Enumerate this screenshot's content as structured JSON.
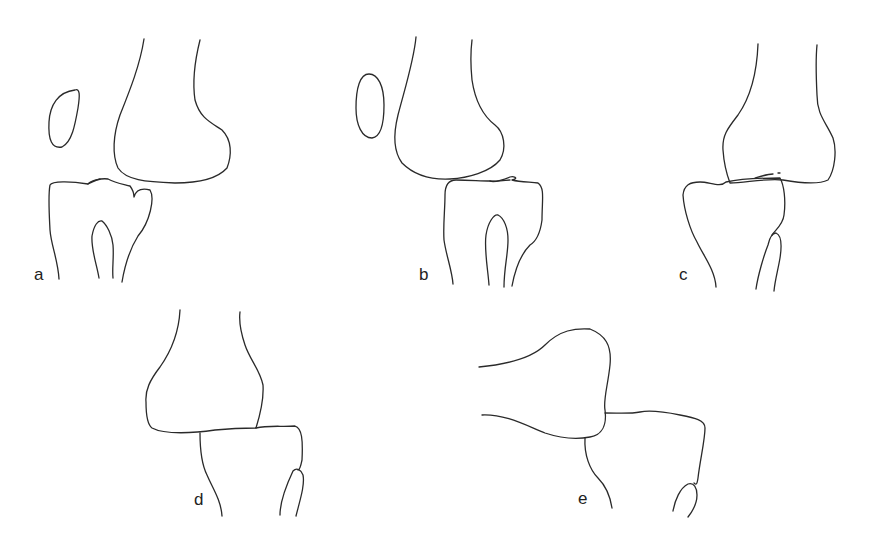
{
  "figure": {
    "type": "anatomical line drawing",
    "stroke_color": "#2a2a2a",
    "background": "#ffffff",
    "panels": [
      {
        "id": "a",
        "label": "a",
        "label_pos": [
          36,
          281
        ],
        "elements": [
          "femur",
          "patella",
          "tibia",
          "fibula"
        ]
      },
      {
        "id": "b",
        "label": "b",
        "label_pos": [
          421,
          281
        ],
        "elements": [
          "femur",
          "patella",
          "tibia",
          "fibula"
        ]
      },
      {
        "id": "c",
        "label": "c",
        "label_pos": [
          681,
          281
        ],
        "elements": [
          "femur",
          "tibia",
          "fibula"
        ]
      },
      {
        "id": "d",
        "label": "d",
        "label_pos": [
          196,
          506
        ],
        "elements": [
          "femur",
          "tibia",
          "fibula"
        ]
      },
      {
        "id": "e",
        "label": "e",
        "label_pos": [
          580,
          505
        ],
        "elements": [
          "femur",
          "tibia",
          "fibula"
        ]
      }
    ]
  }
}
